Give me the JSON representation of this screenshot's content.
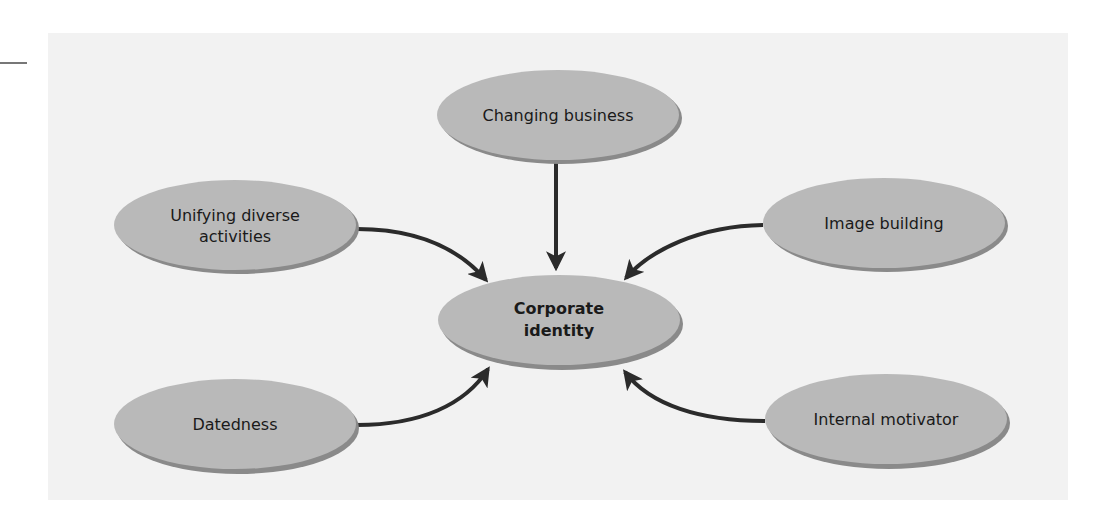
{
  "colors": {
    "panel": "#f2f2f2",
    "node_fill": "#b9b9b9",
    "node_shadow": "#8a8a8a",
    "arrow": "#2b2b2b",
    "text": "#1a1a1a"
  },
  "diagram": {
    "center": {
      "label_line1": "Corporate",
      "label_line2": "identity"
    },
    "nodes": [
      {
        "id": "changing-business",
        "label": "Changing business"
      },
      {
        "id": "unifying-diverse-activities",
        "label_line1": "Unifying diverse",
        "label_line2": "activities"
      },
      {
        "id": "image-building",
        "label": "Image building"
      },
      {
        "id": "datedness",
        "label": "Datedness"
      },
      {
        "id": "internal-motivator",
        "label": "Internal motivator"
      }
    ],
    "edges": [
      {
        "from": "Changing business",
        "to": "Corporate identity"
      },
      {
        "from": "Unifying diverse activities",
        "to": "Corporate identity"
      },
      {
        "from": "Image building",
        "to": "Corporate identity"
      },
      {
        "from": "Datedness",
        "to": "Corporate identity"
      },
      {
        "from": "Internal motivator",
        "to": "Corporate identity"
      }
    ]
  }
}
